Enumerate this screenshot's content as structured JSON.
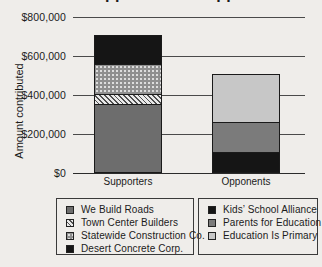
{
  "title": "Supporters vs. Opponents",
  "chart_data": {
    "type": "bar",
    "stacked": true,
    "title": "Supporters vs. Opponents",
    "xlabel": "",
    "ylabel": "Amount contributed",
    "ylim": [
      0,
      800000
    ],
    "grid": "horizontal",
    "legend_position": "bottom, two bordered boxes",
    "yticks": [
      {
        "value": 800000,
        "label": "$800,000"
      },
      {
        "value": 600000,
        "label": "$600,000"
      },
      {
        "value": 400000,
        "label": "$400,000"
      },
      {
        "value": 200000,
        "label": "$200,000"
      },
      {
        "value": 0,
        "label": "$0"
      }
    ],
    "categories": [
      "Supporters",
      "Opponents"
    ],
    "stacks": [
      {
        "category": "Supporters",
        "total": 700000,
        "segments": [
          {
            "label": "We Build Roads",
            "value": 350000,
            "fill": "gray"
          },
          {
            "label": "Town Center Builders",
            "value": 50000,
            "fill": "hatch"
          },
          {
            "label": "Statewide Construction Co.",
            "value": 150000,
            "fill": "dots"
          },
          {
            "label": "Desert Concrete Corp.",
            "value": 150000,
            "fill": "black"
          }
        ]
      },
      {
        "category": "Opponents",
        "total": 500000,
        "segments": [
          {
            "label": "Kids’ School Alliance",
            "value": 100000,
            "fill": "black"
          },
          {
            "label": "Parents for Education",
            "value": 150000,
            "fill": "midgray"
          },
          {
            "label": "Education Is Primary",
            "value": 250000,
            "fill": "lightgray"
          }
        ]
      }
    ]
  },
  "legend_boxes": [
    {
      "items": [
        {
          "label": "We Build Roads",
          "fill": "gray"
        },
        {
          "label": "Town Center Builders",
          "fill": "hatch"
        },
        {
          "label": "Statewide Construction Co.",
          "fill": "dots"
        },
        {
          "label": "Desert Concrete Corp.",
          "fill": "black"
        }
      ]
    },
    {
      "items": [
        {
          "label": "Kids’ School Alliance",
          "fill": "black"
        },
        {
          "label": "Parents for Education",
          "fill": "midgray"
        },
        {
          "label": "Education Is Primary",
          "fill": "lightgray"
        }
      ]
    }
  ],
  "colors": {
    "page-bg": "#efedea",
    "text": "#1b1b1b",
    "grid": "#4a4a4a",
    "axis": "#2b2b2b",
    "outline": "#1a1a1a",
    "gray": "#6d6d6d",
    "black": "#151515",
    "midgray": "#7b7b7b",
    "lightgray": "#c7c7c7",
    "dots-bg": "#8f8f8f",
    "dots-dot": "#dddddd",
    "hatch-bg": "#e9e9e9",
    "hatch-line": "#4f4f4f",
    "legend-border": "#3a3a3a"
  }
}
